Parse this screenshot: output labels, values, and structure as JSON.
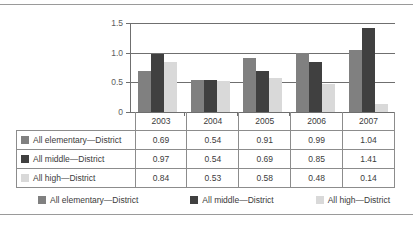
{
  "chart_data": {
    "type": "bar",
    "title": "",
    "xlabel": "",
    "ylabel": "",
    "ylim": [
      0,
      1.5
    ],
    "yticks": [
      "0",
      "0.5",
      "1.0",
      "1.5"
    ],
    "ytick_values": [
      0,
      0.5,
      1.0,
      1.5
    ],
    "grid": true,
    "legend_position": "bottom",
    "categories": [
      "2003",
      "2004",
      "2005",
      "2006",
      "2007"
    ],
    "series": [
      {
        "name": "All elementary—District",
        "color": "#808080",
        "values": [
          0.69,
          0.54,
          0.91,
          0.99,
          1.04
        ]
      },
      {
        "name": "All middle—District",
        "color": "#404040",
        "values": [
          0.97,
          0.54,
          0.69,
          0.85,
          1.41
        ]
      },
      {
        "name": "All high—District",
        "color": "#d9d9d9",
        "values": [
          0.84,
          0.53,
          0.58,
          0.48,
          0.14
        ]
      }
    ]
  },
  "table": {
    "corner_label": "",
    "year_headers": [
      "2003",
      "2004",
      "2005",
      "2006",
      "2007"
    ],
    "rows": [
      {
        "label": "All elementary—District",
        "swatch": "#808080",
        "cells": [
          "0.69",
          "0.54",
          "0.91",
          "0.99",
          "1.04"
        ]
      },
      {
        "label": "All middle—District",
        "swatch": "#404040",
        "cells": [
          "0.97",
          "0.54",
          "0.69",
          "0.85",
          "1.41"
        ]
      },
      {
        "label": "All high—District",
        "swatch": "#d9d9d9",
        "cells": [
          "0.84",
          "0.53",
          "0.58",
          "0.48",
          "0.14"
        ]
      }
    ]
  },
  "legend": {
    "items": [
      {
        "label": "All elementary—District",
        "color": "#808080"
      },
      {
        "label": "All middle—District",
        "color": "#404040"
      },
      {
        "label": "All high—District",
        "color": "#d9d9d9"
      }
    ]
  },
  "axis": {
    "y_labels": [
      "1.5",
      "1.0",
      "0.5",
      "0"
    ]
  }
}
